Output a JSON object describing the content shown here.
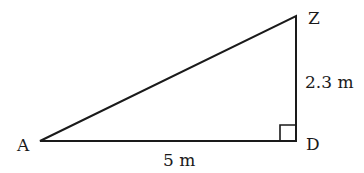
{
  "diagram": {
    "type": "right-triangle",
    "vertices": {
      "A": {
        "label": "A"
      },
      "Z": {
        "label": "Z"
      },
      "D": {
        "label": "D"
      }
    },
    "right_angle_at": "D",
    "sides": {
      "AD": {
        "label": "5 m"
      },
      "DZ": {
        "label": "2.3 m"
      }
    },
    "colors": {
      "stroke": "#1a1a1a",
      "background": "#ffffff"
    }
  }
}
